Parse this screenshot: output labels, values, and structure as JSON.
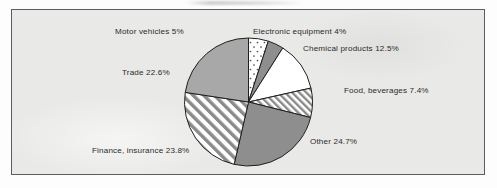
{
  "figure": {
    "background_color": "#e9e9e7",
    "border_color": "#5c5c5c",
    "page_color": "#fdfdfd"
  },
  "chart_data": {
    "type": "pie",
    "title": "",
    "subtitle": "",
    "xlabel": "",
    "ylabel": "",
    "legend_position": "none",
    "grid": false,
    "label_format": "{name} {value}%",
    "start_angle_deg": 0,
    "direction": "clockwise",
    "total": 100,
    "categories": [
      "Motor vehicles",
      "Electronic equipment",
      "Chemical products",
      "Food, beverages",
      "Other",
      "Finance, insurance",
      "Trade"
    ],
    "values": [
      5,
      4,
      12.5,
      7.4,
      24.7,
      23.8,
      22.6
    ],
    "slices": [
      {
        "name": "Motor vehicles",
        "value": 5,
        "label": "Motor vehicles 5%",
        "fill": "dotted",
        "color": "#ffffff"
      },
      {
        "name": "Electronic equipment",
        "value": 4,
        "label": "Electronic equipment 4%",
        "fill": "solid",
        "color": "#8e8e8e"
      },
      {
        "name": "Chemical products",
        "value": 12.5,
        "label": "Chemical products 12.5%",
        "fill": "solid",
        "color": "#ffffff"
      },
      {
        "name": "Food, beverages",
        "value": 7.4,
        "label": "Food, beverages 7.4%",
        "fill": "hatch-narrow",
        "color": "#ffffff"
      },
      {
        "name": "Other",
        "value": 24.7,
        "label": "Other 24.7%",
        "fill": "solid",
        "color": "#8e8e8e"
      },
      {
        "name": "Finance, insurance",
        "value": 23.8,
        "label": "Finance, insurance 23.8%",
        "fill": "hatch-wide",
        "color": "#ffffff"
      },
      {
        "name": "Trade",
        "value": 22.6,
        "label": "Trade 22.6%",
        "fill": "solid",
        "color": "#a8a8a8"
      }
    ]
  }
}
